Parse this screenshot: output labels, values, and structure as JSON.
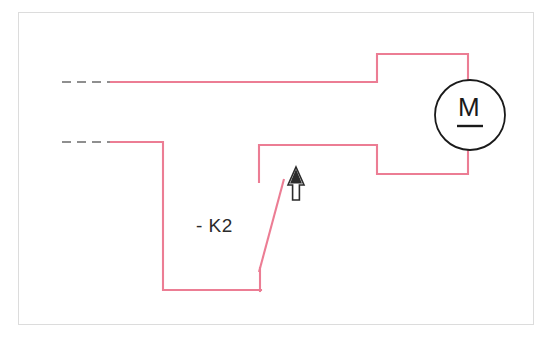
{
  "diagram": {
    "type": "electrical-schematic",
    "colors": {
      "wire": "#ec7d94",
      "wire_dashed": "#8f8f8f",
      "symbol": "#1a1a1a",
      "frame": "#dcdcdc",
      "background": "#ffffff"
    },
    "canvas": {
      "width": 552,
      "height": 339
    }
  },
  "labels": {
    "contactor": "- K2",
    "motor": "M"
  },
  "symbols": {
    "motor": {
      "name": "dc-motor",
      "letter": "M",
      "has_underline": true,
      "center_x": 470,
      "center_y": 115,
      "radius": 35
    },
    "actuation_arrow": {
      "name": "manual-actuation-arrow",
      "direction": "up",
      "style": "double-line",
      "x": 296,
      "y_top": 168,
      "y_bottom": 200
    },
    "contact": {
      "name": "normally-open-contact",
      "designation": "- K2",
      "from_x": 283,
      "from_y": 181,
      "to_x": 260,
      "to_y": 270
    }
  },
  "wires": {
    "dashed_upper": {
      "x1": 62,
      "y1": 82,
      "x2": 112,
      "y2": 82
    },
    "dashed_lower": {
      "x1": 62,
      "y1": 142,
      "x2": 112,
      "y2": 142
    },
    "upper_run": "M112,82 L377,82 L377,54 L468,54 L468,80",
    "lower_run_left": "M112,142 L163,142 L163,290 L260,290",
    "lower_run_right": "M260,181 L260,181 L260,145 L377,145 L377,174 L468,174 L468,150",
    "contact_arm": "M283,181 L260,270"
  }
}
